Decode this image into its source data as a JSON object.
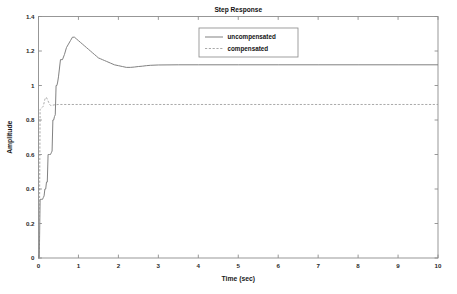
{
  "chart_data": {
    "type": "line",
    "title": "Step Response",
    "xlabel": "Time (sec)",
    "ylabel": "Amplitude",
    "xlim": [
      0,
      10
    ],
    "ylim": [
      0,
      1.4
    ],
    "grid": false,
    "legend_position": "top-center",
    "xticks": [
      "0",
      "1",
      "2",
      "3",
      "4",
      "5",
      "6",
      "7",
      "8",
      "9",
      "10"
    ],
    "xtick_values": [
      0,
      1,
      2,
      3,
      4,
      5,
      6,
      7,
      8,
      9,
      10
    ],
    "yticks": [
      "0",
      "0.2",
      "0.4",
      "0.6",
      "0.8",
      "1",
      "1.2",
      "1.4"
    ],
    "ytick_values": [
      0,
      0.2,
      0.4,
      0.6,
      0.8,
      1,
      1.2,
      1.4
    ],
    "series": [
      {
        "name": "uncompensated",
        "style": "solid",
        "color": "#7a7a7a",
        "steady_state": 1.12,
        "peak_value": 1.28,
        "peak_time": 0.85,
        "x": [
          0.0,
          0.02,
          0.04,
          0.06,
          0.08,
          0.1,
          0.12,
          0.14,
          0.16,
          0.18,
          0.2,
          0.22,
          0.24,
          0.26,
          0.28,
          0.3,
          0.32,
          0.34,
          0.36,
          0.38,
          0.4,
          0.42,
          0.44,
          0.46,
          0.48,
          0.5,
          0.55,
          0.6,
          0.65,
          0.7,
          0.75,
          0.8,
          0.85,
          0.9,
          0.95,
          1.0,
          1.05,
          1.1,
          1.15,
          1.2,
          1.25,
          1.3,
          1.35,
          1.4,
          1.45,
          1.5,
          1.55,
          1.6,
          1.65,
          1.7,
          1.8,
          1.9,
          2.0,
          2.1,
          2.2,
          2.3,
          2.4,
          2.5,
          2.6,
          2.7,
          2.8,
          3.0,
          3.5,
          4.0,
          5.0,
          6.0,
          7.0,
          8.0,
          9.0,
          10.0
        ],
        "y": [
          0.0,
          0.0,
          0.34,
          0.34,
          0.34,
          0.34,
          0.35,
          0.36,
          0.4,
          0.4,
          0.44,
          0.44,
          0.6,
          0.6,
          0.6,
          0.6,
          0.61,
          0.62,
          0.8,
          0.8,
          0.82,
          0.83,
          1.0,
          1.0,
          1.02,
          1.05,
          1.15,
          1.15,
          1.18,
          1.22,
          1.24,
          1.26,
          1.28,
          1.28,
          1.27,
          1.26,
          1.25,
          1.24,
          1.23,
          1.22,
          1.21,
          1.2,
          1.19,
          1.18,
          1.17,
          1.16,
          1.155,
          1.15,
          1.145,
          1.14,
          1.13,
          1.12,
          1.115,
          1.11,
          1.105,
          1.105,
          1.107,
          1.11,
          1.112,
          1.115,
          1.117,
          1.119,
          1.12,
          1.12,
          1.12,
          1.12,
          1.12,
          1.12,
          1.12,
          1.12
        ]
      },
      {
        "name": "compensated",
        "style": "dashed",
        "color": "#9a9a9a",
        "steady_state": 0.89,
        "peak_value": 0.93,
        "peak_time": 0.2,
        "x": [
          0.0,
          0.02,
          0.04,
          0.08,
          0.12,
          0.14,
          0.16,
          0.18,
          0.2,
          0.22,
          0.24,
          0.26,
          0.28,
          0.3,
          0.32,
          0.34,
          0.36,
          0.4,
          0.45,
          0.5,
          0.6,
          0.8,
          1.0,
          1.5,
          2.0,
          3.0,
          4.0,
          5.0,
          6.0,
          7.0,
          8.0,
          9.0,
          10.0
        ],
        "y": [
          0.0,
          0.0,
          0.86,
          0.87,
          0.88,
          0.9,
          0.92,
          0.93,
          0.93,
          0.92,
          0.91,
          0.9,
          0.89,
          0.885,
          0.884,
          0.885,
          0.886,
          0.888,
          0.889,
          0.89,
          0.89,
          0.89,
          0.89,
          0.89,
          0.89,
          0.89,
          0.89,
          0.89,
          0.89,
          0.89,
          0.89,
          0.89,
          0.89
        ]
      }
    ],
    "legend": [
      {
        "label": "uncompensated",
        "style": "solid"
      },
      {
        "label": "compensated",
        "style": "dashed"
      }
    ]
  }
}
